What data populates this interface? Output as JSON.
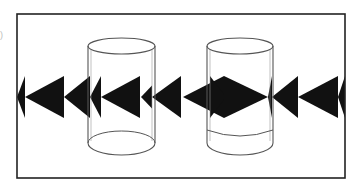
{
  "figure": {
    "panel_label": ")",
    "colors": {
      "ink": "#111111",
      "paper": "#ffffff",
      "frame": "#222222",
      "glass": "#555555"
    }
  },
  "frame": {
    "x": 17,
    "y": 14,
    "width": 328,
    "height": 164
  },
  "arrow_band": {
    "center_y": 97,
    "half_height": 21
  },
  "arrows": [
    {
      "tip_x": 17,
      "base_x": 25,
      "dir": "left",
      "clipped": true
    },
    {
      "tip_x": 25,
      "base_x": 64,
      "dir": "left"
    },
    {
      "tip_x": 64,
      "base_x": 90,
      "dir": "left"
    },
    {
      "tip_x": 90,
      "base_x": 101,
      "dir": "left"
    },
    {
      "tip_x": 101,
      "base_x": 140,
      "dir": "left"
    },
    {
      "tip_x": 141,
      "base_x": 152,
      "dir": "left",
      "small": true
    },
    {
      "tip_x": 152,
      "base_x": 181,
      "dir": "left"
    },
    {
      "tip_x": 183,
      "base_x": 224,
      "dir": "left"
    },
    {
      "tip_x": 226,
      "base_x": 210,
      "dir": "right",
      "inside_water": true
    },
    {
      "tip_x": 268,
      "base_x": 224,
      "dir": "right",
      "inside_water": true
    },
    {
      "tip_x": 268,
      "base_x": 272,
      "dir": "left",
      "clipped": true
    },
    {
      "tip_x": 272,
      "base_x": 298,
      "dir": "left"
    },
    {
      "tip_x": 298,
      "base_x": 338,
      "dir": "left"
    },
    {
      "tip_x": 338,
      "base_x": 345,
      "dir": "left",
      "clipped": true
    }
  ],
  "cylinders": [
    {
      "name": "empty-glass",
      "left": 88,
      "right": 155,
      "top_y": 46,
      "bottom_y": 143,
      "rx": 33.5,
      "ry": 8,
      "water": false
    },
    {
      "name": "water-glass",
      "left": 207,
      "right": 273,
      "top_y": 46,
      "bottom_y": 143,
      "rx": 33,
      "ry": 8,
      "water": true,
      "water_line_y": 136
    }
  ]
}
